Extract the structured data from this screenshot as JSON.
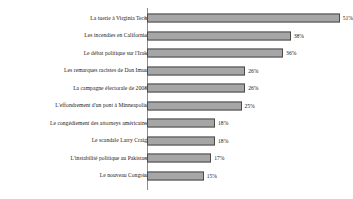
{
  "chart_data": {
    "type": "bar",
    "orientation": "horizontal",
    "title": "",
    "subtitle": "",
    "xlabel": "",
    "ylabel": "",
    "grid": false,
    "legend": "none",
    "xlim": [
      0,
      55
    ],
    "categories": [
      "La tuerie à Virginia Tech",
      "Les incendies en Californie",
      "Le débat politique sur l'Irak",
      "Les remarques racistes de Don Imus",
      "La campagne électorale de 2008",
      "L'effondrement d'un pont à Minneapolis",
      "Le congédiement des attorneys américains",
      "Le scandale Larry Craig",
      "L'instabilité politique au Pakistan",
      "Le nouveau Congrès"
    ],
    "values": [
      51,
      38,
      36,
      26,
      26,
      25,
      18,
      18,
      17,
      15
    ],
    "value_labels": [
      "51%",
      "38%",
      "36%",
      "26%",
      "26%",
      "25%",
      "18%",
      "18%",
      "17%",
      "15%"
    ],
    "bar_fill_color": "#a6a6a6",
    "bar_border_color": "#4a4a4a",
    "axis_color": "#8c8c8c",
    "text_color": "#1a1a1a",
    "background_color": "#ffffff"
  }
}
